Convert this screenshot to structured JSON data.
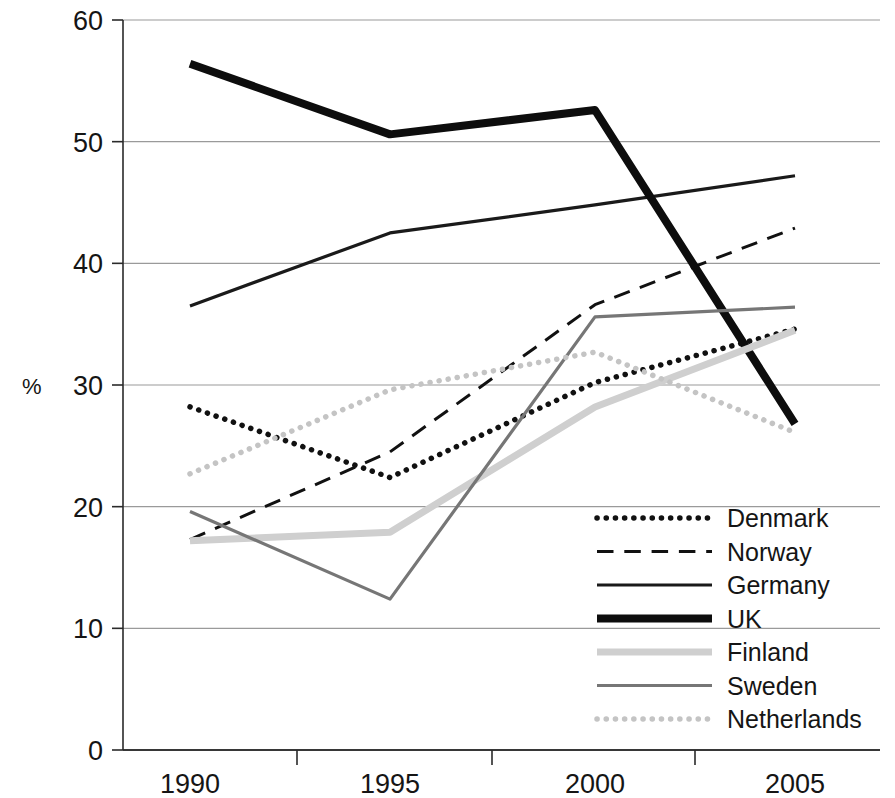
{
  "chart_data": {
    "type": "line",
    "title": "",
    "subtitle": "",
    "xlabel": "",
    "ylabel": "%",
    "x": [
      "1990",
      "1995",
      "2000",
      "2005"
    ],
    "categories": [
      "1990",
      "1995",
      "2000",
      "2005"
    ],
    "xtick_labels": [
      "1990",
      "1995",
      "2000",
      "2005"
    ],
    "ytick_labels": [
      "0",
      "10",
      "20",
      "30",
      "40",
      "50",
      "60"
    ],
    "yticks": [
      0,
      10,
      20,
      30,
      40,
      50,
      60
    ],
    "ylim": [
      0,
      60
    ],
    "grid": "horizontal",
    "legend_position": "bottom-right",
    "series": [
      {
        "name": "Denmark",
        "values": [
          28.2,
          22.4,
          30.2,
          34.6
        ],
        "style": "dotted",
        "color": "#111111",
        "width": 5.5
      },
      {
        "name": "Norway",
        "values": [
          17.3,
          24.5,
          36.6,
          42.9
        ],
        "style": "dashed",
        "color": "#111111",
        "width": 3
      },
      {
        "name": "Germany",
        "values": [
          36.5,
          42.5,
          44.8,
          47.2
        ],
        "style": "solid",
        "color": "#1a1a1a",
        "width": 3.2
      },
      {
        "name": "UK",
        "values": [
          56.4,
          50.6,
          52.6,
          26.8
        ],
        "style": "solid",
        "color": "#0d0d0d",
        "width": 8
      },
      {
        "name": "Finland",
        "values": [
          17.2,
          17.9,
          28.2,
          34.5
        ],
        "style": "solid",
        "color": "#cfcfcf",
        "width": 7
      },
      {
        "name": "Sweden",
        "values": [
          19.6,
          12.4,
          35.6,
          36.4
        ],
        "style": "solid",
        "color": "#767676",
        "width": 3.2
      },
      {
        "name": "Netherlands",
        "values": [
          22.7,
          29.6,
          32.7,
          26.1
        ],
        "style": "dotted",
        "color": "#c4c4c4",
        "width": 5.5
      }
    ]
  },
  "legend": {
    "items": [
      {
        "label": "Denmark"
      },
      {
        "label": "Norway"
      },
      {
        "label": "Germany"
      },
      {
        "label": "UK"
      },
      {
        "label": "Finland"
      },
      {
        "label": "Sweden"
      },
      {
        "label": "Netherlands"
      }
    ]
  },
  "axes": {
    "y_axis_title": "%",
    "y_labels": [
      "60",
      "50",
      "40",
      "30",
      "20",
      "10",
      "0"
    ],
    "x_labels": [
      "1990",
      "1995",
      "2000",
      "2005"
    ]
  }
}
